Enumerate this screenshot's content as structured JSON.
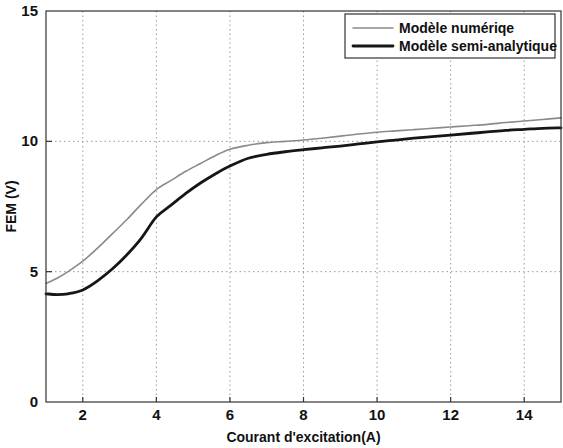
{
  "chart_data": {
    "type": "line",
    "title": "",
    "xlabel": "Courant d'excitation(A)",
    "ylabel": "FEM (V)",
    "xlim": [
      1,
      15
    ],
    "ylim": [
      0,
      15
    ],
    "xticks": [
      2,
      4,
      6,
      8,
      10,
      12,
      14
    ],
    "yticks": [
      0,
      5,
      10,
      15
    ],
    "xtick_labels": [
      "2",
      "4",
      "6",
      "8",
      "10",
      "12",
      "14"
    ],
    "ytick_labels": [
      "0",
      "5",
      "10",
      "15"
    ],
    "grid": true,
    "grid_style": "dotted",
    "legend_position": "top-right",
    "series": [
      {
        "name": "Modèle numériqe",
        "color": "#8a8a8a",
        "width": 1.6,
        "x": [
          1.0,
          1.3,
          1.6,
          2.0,
          2.4,
          2.8,
          3.2,
          3.6,
          4.0,
          4.4,
          4.8,
          5.2,
          5.6,
          6.0,
          6.5,
          7.0,
          7.5,
          8.0,
          8.5,
          9.0,
          9.5,
          10.0,
          10.5,
          11.0,
          11.5,
          12.0,
          12.5,
          13.0,
          13.5,
          14.0,
          14.5,
          15.0
        ],
        "y": [
          4.55,
          4.75,
          5.0,
          5.4,
          5.9,
          6.45,
          7.0,
          7.6,
          8.15,
          8.5,
          8.85,
          9.15,
          9.45,
          9.7,
          9.85,
          9.95,
          10.0,
          10.05,
          10.12,
          10.2,
          10.28,
          10.35,
          10.4,
          10.45,
          10.5,
          10.55,
          10.6,
          10.65,
          10.72,
          10.78,
          10.84,
          10.9
        ]
      },
      {
        "name": "Modèle semi-analytique",
        "color": "#161616",
        "width": 2.8,
        "x": [
          1.0,
          1.3,
          1.6,
          2.0,
          2.4,
          2.8,
          3.2,
          3.6,
          4.0,
          4.4,
          4.8,
          5.2,
          5.6,
          6.0,
          6.5,
          7.0,
          7.5,
          8.0,
          8.5,
          9.0,
          9.5,
          10.0,
          10.5,
          11.0,
          11.5,
          12.0,
          12.5,
          13.0,
          13.5,
          14.0,
          14.5,
          15.0
        ],
        "y": [
          4.15,
          4.12,
          4.15,
          4.3,
          4.65,
          5.1,
          5.65,
          6.3,
          7.1,
          7.55,
          8.0,
          8.4,
          8.75,
          9.05,
          9.35,
          9.5,
          9.6,
          9.68,
          9.75,
          9.82,
          9.9,
          9.98,
          10.05,
          10.12,
          10.18,
          10.24,
          10.3,
          10.36,
          10.42,
          10.46,
          10.5,
          10.52
        ]
      }
    ]
  },
  "legend": {
    "items": [
      {
        "label": "Modèle numériqe"
      },
      {
        "label": "Modèle semi-analytique"
      }
    ]
  },
  "colors": {
    "axis": "#333333",
    "grid": "#9a9a9a",
    "numeric_model": "#8a8a8a",
    "semi_analytic_model": "#161616",
    "background": "#ffffff"
  }
}
